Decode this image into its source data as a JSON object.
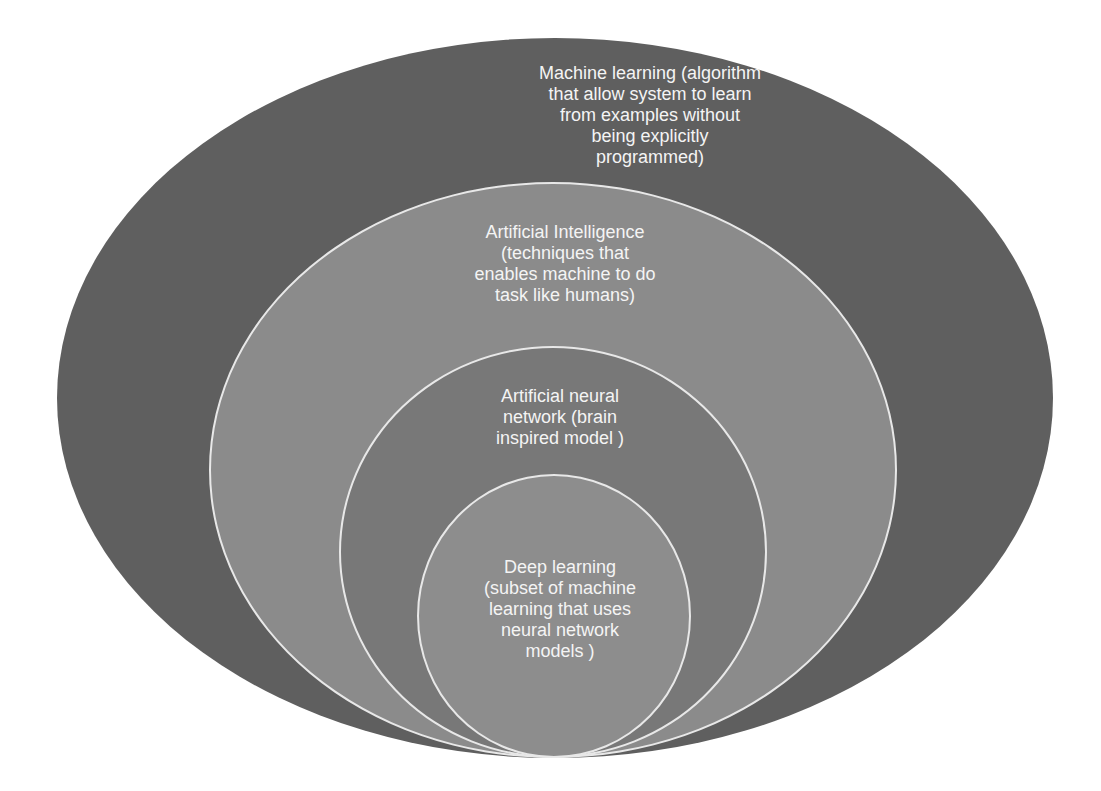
{
  "diagram": {
    "type": "nested-ellipses",
    "layers": [
      {
        "id": "machine-learning",
        "title": "Machine learning",
        "text": "Machine learning (algorithm\nthat allow system to learn\nfrom examples without\nbeing explicitly\nprogrammed)",
        "color": "#5f5f5f"
      },
      {
        "id": "artificial-intelligence",
        "title": "Artificial Intelligence",
        "text": "Artificial Intelligence\n(techniques that\nenables machine to do\ntask like humans)",
        "color": "#8b8b8b"
      },
      {
        "id": "artificial-neural-network",
        "title": "Artificial neural network",
        "text": "Artificial neural\nnetwork (brain\ninspired model )",
        "color": "#787878"
      },
      {
        "id": "deep-learning",
        "title": "Deep learning",
        "text": "Deep learning\n(subset of machine\nlearning that uses\nneural network\nmodels )",
        "color": "#8d8d8d"
      }
    ],
    "border_color": "#e8e8e8",
    "background": "#ffffff",
    "text_color": "#f4f4f4"
  }
}
